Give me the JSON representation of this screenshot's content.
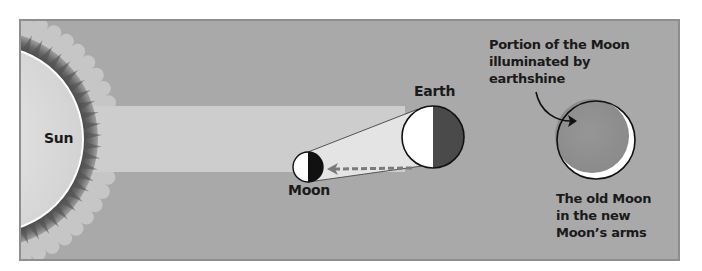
{
  "figure": {
    "colors": {
      "panel_background": "#a8a8a8",
      "panel_border": "#8c8c8c",
      "sunlight_beam": "#cfcfcf",
      "sun_disc": "#dcdcdc",
      "sun_halo": "#c4c4c4",
      "corona_dark": "#5a5a5a",
      "lit_side": "#ffffff",
      "earth_dark_side": "#4a4a4a",
      "moon_dark_side": "#111111",
      "earthshine_moon": "#8f8f8f",
      "dashed_arrow": "#777777",
      "outline": "#111111"
    }
  },
  "labels": {
    "sun": "Sun",
    "earth": "Earth",
    "moon": "Moon",
    "earthshine_callout": [
      "Portion of the Moon",
      "illuminated by",
      "earthshine"
    ],
    "old_moon_caption": [
      "The old Moon",
      "in the new",
      "Moon’s arms"
    ]
  },
  "bodies": {
    "sun": {
      "cx": -10,
      "cy": 139,
      "r": 93
    },
    "earth": {
      "cx": 433,
      "cy": 137,
      "r": 31
    },
    "moon": {
      "cx": 308,
      "cy": 167,
      "r": 15
    },
    "earthshine_moon": {
      "cx": 596,
      "cy": 140,
      "r": 39
    }
  }
}
